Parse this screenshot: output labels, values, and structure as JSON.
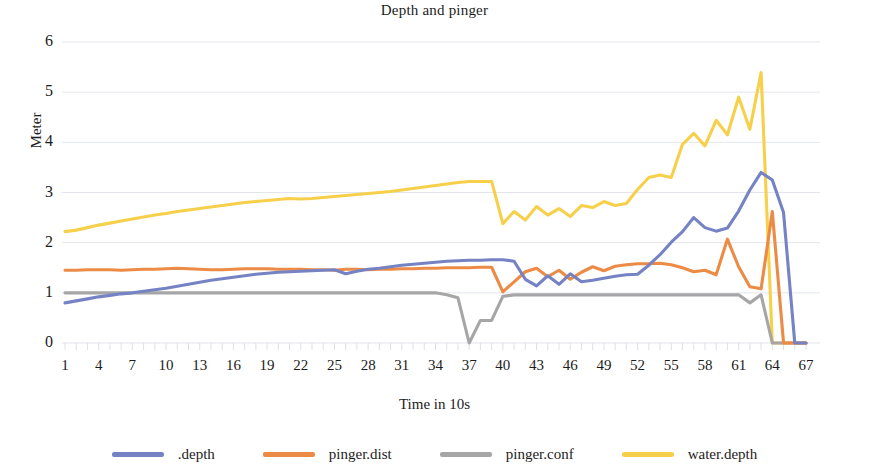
{
  "chart_data": {
    "type": "line",
    "title": "Depth and pinger",
    "xlabel": "Time in 10s",
    "ylabel": "Meter",
    "xlim": [
      1,
      67
    ],
    "ylim": [
      0,
      6
    ],
    "grid": true,
    "legend_position": "bottom",
    "y_ticks": [
      "6",
      "5",
      "4",
      "3",
      "2",
      "1",
      "0"
    ],
    "x_ticks": [
      "1",
      "4",
      "7",
      "10",
      "13",
      "16",
      "19",
      "22",
      "25",
      "28",
      "31",
      "34",
      "37",
      "40",
      "43",
      "46",
      "49",
      "52",
      "55",
      "58",
      "61",
      "64",
      "67"
    ],
    "x": [
      1,
      2,
      3,
      4,
      5,
      6,
      7,
      8,
      9,
      10,
      11,
      12,
      13,
      14,
      15,
      16,
      17,
      18,
      19,
      20,
      21,
      22,
      23,
      24,
      25,
      26,
      27,
      28,
      29,
      30,
      31,
      32,
      33,
      34,
      35,
      36,
      37,
      38,
      39,
      40,
      41,
      42,
      43,
      44,
      45,
      46,
      47,
      48,
      49,
      50,
      51,
      52,
      53,
      54,
      55,
      56,
      57,
      58,
      59,
      60,
      61,
      62,
      63,
      64,
      65,
      66,
      67
    ],
    "series": [
      {
        "name": ".depth",
        "color": "#7583c4",
        "values": [
          0.8,
          0.84,
          0.88,
          0.92,
          0.95,
          0.98,
          1.0,
          1.03,
          1.06,
          1.09,
          1.13,
          1.17,
          1.21,
          1.25,
          1.28,
          1.31,
          1.34,
          1.37,
          1.39,
          1.41,
          1.42,
          1.43,
          1.44,
          1.45,
          1.46,
          1.38,
          1.43,
          1.47,
          1.49,
          1.52,
          1.55,
          1.57,
          1.59,
          1.61,
          1.63,
          1.64,
          1.65,
          1.65,
          1.66,
          1.66,
          1.63,
          1.27,
          1.14,
          1.34,
          1.17,
          1.38,
          1.22,
          1.25,
          1.29,
          1.33,
          1.36,
          1.37,
          1.55,
          1.76,
          2.01,
          2.22,
          2.5,
          2.3,
          2.23,
          2.29,
          2.63,
          3.05,
          3.4,
          3.25,
          2.6,
          0.0,
          0.0
        ]
      },
      {
        "name": "pinger.dist",
        "color": "#ec8b45",
        "values": [
          1.45,
          1.45,
          1.46,
          1.46,
          1.46,
          1.45,
          1.46,
          1.47,
          1.47,
          1.48,
          1.49,
          1.48,
          1.47,
          1.46,
          1.46,
          1.47,
          1.48,
          1.48,
          1.48,
          1.47,
          1.47,
          1.47,
          1.46,
          1.46,
          1.45,
          1.47,
          1.47,
          1.46,
          1.47,
          1.47,
          1.48,
          1.48,
          1.49,
          1.49,
          1.5,
          1.5,
          1.5,
          1.51,
          1.51,
          1.02,
          1.22,
          1.42,
          1.49,
          1.32,
          1.45,
          1.27,
          1.41,
          1.52,
          1.44,
          1.53,
          1.56,
          1.58,
          1.58,
          1.59,
          1.56,
          1.5,
          1.42,
          1.45,
          1.36,
          2.07,
          1.52,
          1.12,
          1.08,
          2.62,
          0.0,
          0.0,
          0.0
        ]
      },
      {
        "name": "pinger.conf",
        "color": "#a6a6a6",
        "values": [
          1.0,
          1.0,
          1.0,
          1.0,
          1.0,
          1.0,
          1.0,
          1.0,
          1.0,
          1.0,
          1.0,
          1.0,
          1.0,
          1.0,
          1.0,
          1.0,
          1.0,
          1.0,
          1.0,
          1.0,
          1.0,
          1.0,
          1.0,
          1.0,
          1.0,
          1.0,
          1.0,
          1.0,
          1.0,
          1.0,
          1.0,
          1.0,
          1.0,
          1.0,
          0.96,
          0.9,
          0.0,
          0.45,
          0.45,
          0.93,
          0.96,
          0.96,
          0.96,
          0.96,
          0.96,
          0.96,
          0.96,
          0.96,
          0.96,
          0.96,
          0.96,
          0.96,
          0.96,
          0.96,
          0.96,
          0.96,
          0.96,
          0.96,
          0.96,
          0.96,
          0.96,
          0.8,
          0.96,
          0.0,
          0.0,
          0.0,
          0.0
        ]
      },
      {
        "name": "water.depth",
        "color": "#fcd champion",
        "values": [
          2.22,
          2.25,
          2.3,
          2.35,
          2.39,
          2.43,
          2.47,
          2.51,
          2.55,
          2.58,
          2.62,
          2.65,
          2.68,
          2.71,
          2.74,
          2.77,
          2.8,
          2.82,
          2.84,
          2.86,
          2.88,
          2.87,
          2.88,
          2.9,
          2.92,
          2.94,
          2.96,
          2.98,
          3.0,
          3.02,
          3.05,
          3.08,
          3.11,
          3.14,
          3.17,
          3.2,
          3.22,
          3.22,
          3.22,
          2.38,
          2.62,
          2.45,
          2.72,
          2.55,
          2.68,
          2.52,
          2.74,
          2.7,
          2.82,
          2.74,
          2.78,
          3.06,
          3.3,
          3.35,
          3.3,
          3.96,
          4.18,
          3.93,
          4.44,
          4.15,
          4.9,
          4.26,
          5.39,
          0.0,
          0.0,
          0.0,
          0.0
        ]
      }
    ]
  },
  "legend": {
    "items": [
      {
        "label": ".depth",
        "color": "#7583c4"
      },
      {
        "label": "pinger.dist",
        "color": "#ec8b45"
      },
      {
        "label": "pinger.conf",
        "color": "#a6a6a6"
      },
      {
        "label": "water.depth",
        "color": "#f7d04b"
      }
    ]
  },
  "colors": {
    "depth": "#7583c4",
    "pinger_dist": "#ec8b45",
    "pinger_conf": "#a6a6a6",
    "water_depth": "#f7d04b",
    "gridline": "#dfe3ea",
    "text": "#1c1c1c"
  }
}
